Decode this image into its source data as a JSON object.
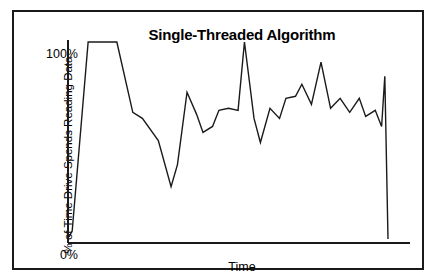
{
  "figure": {
    "title": "Single-Threaded Algorithm",
    "x_axis_title": "Time",
    "y_axis_title": "% of Time Drive Spends Reading Data",
    "y_tick_top": "100%",
    "y_tick_bottom": "0%",
    "line_color": "#1a1a1a",
    "axis_color": "#1a1a1a",
    "frame_color": "#1a1a1a",
    "background_color": "#ffffff"
  },
  "chart_data": {
    "type": "line",
    "title": "Single-Threaded Algorithm",
    "xlabel": "Time",
    "ylabel": "% of Time Drive Spends Reading Data",
    "xlim": [
      0,
      100
    ],
    "ylim": [
      0,
      100
    ],
    "ytick_labels": [
      "0%",
      "100%"
    ],
    "ytick_values": [
      0,
      100
    ],
    "xtick_labels": [],
    "grid": false,
    "legend": false,
    "series": [
      {
        "name": "Drive read utilization",
        "x": [
          0,
          1,
          6,
          15,
          20,
          23,
          28,
          32,
          34,
          37,
          40,
          42,
          45,
          47,
          50,
          53,
          55,
          58,
          60,
          63,
          66,
          68,
          71,
          73,
          76,
          79,
          82,
          85,
          88,
          91,
          93,
          96,
          98,
          99,
          100
        ],
        "values": [
          3,
          6,
          100,
          100,
          65,
          62,
          51,
          28,
          39,
          75,
          64,
          55,
          58,
          66,
          67,
          66,
          100,
          62,
          50,
          67,
          62,
          72,
          73,
          79,
          69,
          90,
          67,
          72,
          65,
          72,
          63,
          66,
          58,
          83,
          2
        ]
      }
    ]
  }
}
